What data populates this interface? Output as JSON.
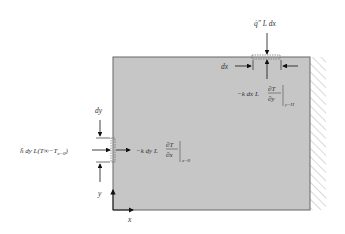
{
  "diagram": {
    "colors": {
      "plate_fill": "#c6c6c6",
      "plate_stroke": "#555555",
      "arrow": "#111111",
      "hatch": "#999999"
    },
    "labels": {
      "top_flux": "q̇″ L dx",
      "dx": "dx",
      "top_conduction_prefix": "−k dx L",
      "top_conduction_num": "∂T",
      "top_conduction_den": "∂y",
      "top_conduction_eval": "y=H",
      "dy": "dy",
      "left_convection": "h̄ dy L(T∞−T",
      "left_convection_sub": "x=0",
      "left_convection_close": ")",
      "left_conduction_prefix": "−k dy L",
      "left_conduction_num": "∂T",
      "left_conduction_den": "∂x",
      "left_conduction_eval": "x=0",
      "y_axis": "y",
      "x_axis": "x"
    }
  }
}
